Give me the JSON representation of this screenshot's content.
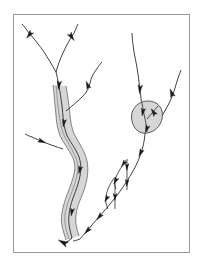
{
  "figure": {
    "canvas": {
      "width": 203,
      "height": 270,
      "background_color": "#ffffff"
    },
    "frame": {
      "name": "figure-border",
      "x": 13,
      "y": 14,
      "width": 177,
      "height": 239,
      "stroke_color": "#9a9a9a",
      "stroke_width": 1,
      "fill": "none"
    },
    "style": {
      "stream_stroke_color": "#2b2b2b",
      "stream_stroke_width": 0.9,
      "corridor_fill_color": "#d6d6d6",
      "corridor_stroke_color": "#555555",
      "corridor_stroke_width": 0.7,
      "lake_fill_color": "#d6d6d6",
      "lake_stroke_color": "#333333",
      "arrowhead_color": "#1a1a1a"
    },
    "legend_visible": false,
    "labels_visible": false,
    "axis_visible": false
  },
  "networks": [
    {
      "id": "left-network",
      "name": "left-drainage-network",
      "has_shaded_corridor": true,
      "outlet_point": [
        72,
        238
      ],
      "channel_count": 6,
      "arrow_count": 10
    },
    {
      "id": "right-network",
      "name": "right-drainage-network",
      "has_shaded_corridor": false,
      "has_lake": true,
      "has_braided_reach": true,
      "outlet_point": [
        80,
        239
      ],
      "channel_count": 7,
      "arrow_count": 13
    }
  ],
  "paths": {
    "left_trunk_centerline": "M 72 238 C 70 230 68 224 69 215 C 70 203 75 194 78 184 C 81 174 82 166 79 157 C 75 147 69 141 66 133 C 63 124 63 114 62 106 C 61 98 60 92 59 86 C 58 80 57 76 56 72",
    "left_corridor_outer_left": "M 66 240 C 63 230 60 223 62 213 C 64 200 69 191 72 181 C 75 172 76 166 73 158 C 69 149 62 142 59 133 C 56 123 56 113 55 105 C 54 97 54 91 53 85",
    "left_corridor_outer_right": "M 79 236 C 77 229 75 223 76 215 C 77 205 82 197 85 187 C 88 177 89 167 86 157 C 82 146 76 139 73 131 C 70 122 70 113 69 106 C 68 98 67 92 66 86",
    "left_branch_upper_left": "M 56 72 C 52 65 48 58 44 52 C 40 46 35 40 29 33 C 26 29 24 26 22 24",
    "left_branch_upper_right": "M 56 72 C 58 65 60 59 63 53 C 66 46 70 39 74 33 C 76 29 77 26 78 24",
    "left_branch_mid_right": "M 66 110 C 72 105 78 100 83 95 C 87 91 89 87 90 82 C 91 77 93 73 96 69 C 98 66 100 63 102 61",
    "left_branch_mid_left": "M 62 148 C 56 146 50 144 45 142 C 40 140 35 138 31 136 C 28 135 26 134 24 133",
    "right_trunk_main": "M 80 239 C 86 232 92 225 98 218 C 105 210 112 202 118 194 C 124 186 129 178 133 171 C 137 164 140 157 142 150 C 144 143 145 137 145 131",
    "right_lake_inflow_left": "M 145 131 C 144 122 143 114 142 106 C 141 98 140 90 139 82 C 138 72 136 62 134 52 C 133 44 132 38 132 33",
    "right_lake_inflow_right": "M 153 131 C 157 124 161 117 165 110 C 169 103 172 96 174 89 C 176 82 178 76 180 71",
    "right_lake_outline": "M 132 121 C 130 113 134 105 142 102 C 151 99 160 103 162 111 C 164 120 159 129 151 132 C 141 136 134 130 132 121 Z",
    "braid_island_upper_left": "M 124 162 C 121 167 118 172 116 177 C 114 181 114 185 116 188",
    "braid_island_upper_right": "M 127 160 C 127 167 127 174 127 181 C 127 185 127 188 127 190",
    "braid_island_lower_left": "M 112 181 C 109 187 106 193 105 199 C 104 203 105 207 107 210",
    "braid_island_lower_right": "M 115 179 C 115 186 115 193 115 199 C 115 203 115 207 115 209"
  },
  "arrows": [
    {
      "name": "arrow-left-upper-left-branch",
      "x": 30,
      "y": 34,
      "angle": 128,
      "size": 5.5
    },
    {
      "name": "arrow-left-upper-right-branch",
      "x": 71,
      "y": 36,
      "angle": 56,
      "size": 5.5
    },
    {
      "name": "arrow-left-trunk-upper",
      "x": 59,
      "y": 84,
      "angle": 96,
      "size": 5.5
    },
    {
      "name": "arrow-left-trunk-mid-upper",
      "x": 64,
      "y": 122,
      "angle": 100,
      "size": 5.0
    },
    {
      "name": "arrow-left-branch-mid-right",
      "x": 88,
      "y": 86,
      "angle": 250,
      "size": 5.0
    },
    {
      "name": "arrow-left-branch-mid-left",
      "x": 41,
      "y": 141,
      "angle": 22,
      "size": 5.0
    },
    {
      "name": "arrow-left-trunk-mid-lower",
      "x": 80,
      "y": 169,
      "angle": 104,
      "size": 5.0
    },
    {
      "name": "arrow-left-trunk-lower",
      "x": 72,
      "y": 211,
      "angle": 100,
      "size": 5.0
    },
    {
      "name": "arrow-left-outlet",
      "x": 64,
      "y": 243,
      "angle": 208,
      "size": 6.5
    },
    {
      "name": "arrow-right-inflow-left",
      "x": 140,
      "y": 88,
      "angle": 95,
      "size": 5.5
    },
    {
      "name": "arrow-right-inflow-right",
      "x": 172,
      "y": 94,
      "angle": 250,
      "size": 5.5
    },
    {
      "name": "arrow-right-lake-in-left",
      "x": 143,
      "y": 111,
      "angle": 100,
      "size": 5.0
    },
    {
      "name": "arrow-right-lake-in-right",
      "x": 154,
      "y": 113,
      "angle": 236,
      "size": 5.0
    },
    {
      "name": "arrow-right-lake-out",
      "x": 147,
      "y": 128,
      "angle": 110,
      "size": 5.0
    },
    {
      "name": "arrow-right-trunk-upper",
      "x": 141,
      "y": 152,
      "angle": 115,
      "size": 5.0
    },
    {
      "name": "arrow-right-braid-a",
      "x": 127,
      "y": 166,
      "angle": 92,
      "size": 4.5
    },
    {
      "name": "arrow-right-braid-b",
      "x": 124,
      "y": 163,
      "angle": 123,
      "size": 4.5
    },
    {
      "name": "arrow-right-braid-c",
      "x": 127,
      "y": 182,
      "angle": 92,
      "size": 4.5
    },
    {
      "name": "arrow-right-braid-d",
      "x": 116,
      "y": 180,
      "angle": 120,
      "size": 4.5
    },
    {
      "name": "arrow-right-braid-e",
      "x": 115,
      "y": 196,
      "angle": 92,
      "size": 4.5
    },
    {
      "name": "arrow-right-braid-f",
      "x": 107,
      "y": 198,
      "angle": 120,
      "size": 4.5
    },
    {
      "name": "arrow-right-trunk-lower",
      "x": 100,
      "y": 216,
      "angle": 130,
      "size": 5.0
    },
    {
      "name": "arrow-right-trunk-outlet",
      "x": 88,
      "y": 230,
      "angle": 133,
      "size": 5.0
    }
  ]
}
